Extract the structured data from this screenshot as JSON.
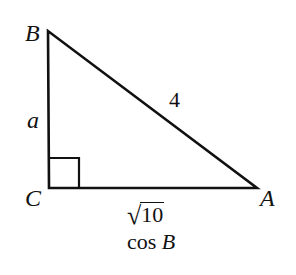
{
  "figure": {
    "type": "right-triangle",
    "stroke_color": "#111111",
    "vertices": {
      "B": {
        "label": "B",
        "x": 48,
        "y": 31
      },
      "C": {
        "label": "C",
        "x": 49,
        "y": 188
      },
      "A": {
        "label": "A",
        "x": 257,
        "y": 188
      }
    },
    "right_angle_at": "C",
    "sides": {
      "BC": {
        "label": "a"
      },
      "AB": {
        "label": "4"
      },
      "CA": {
        "label_radical": "√",
        "label_radicand": "10"
      }
    },
    "caption": {
      "prefix": "cos ",
      "variable": "B"
    }
  }
}
